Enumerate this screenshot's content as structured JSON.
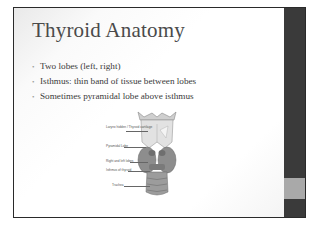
{
  "slide": {
    "title": "Thyroid Anatomy",
    "bullets": [
      "Two lobes (left, right)",
      "Isthmus: thin band of tissue between lobes",
      "Sometimes pyramidal lobe above isthmus"
    ],
    "figure": {
      "labels": [
        "Larynx hidden / Thyroid cartilage",
        "Pyramidal Lobe",
        "Right and left lobes",
        "Isthmus of thyroid",
        "Trachea"
      ]
    },
    "colors": {
      "sidebar": "#3a3a3a",
      "sidebar_accent": "#a9a9a9",
      "title": "#4a4a4a",
      "text": "#3a3a3a"
    }
  }
}
